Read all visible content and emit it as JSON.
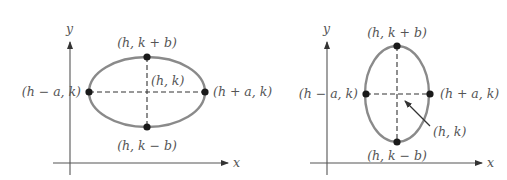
{
  "diagrams": [
    {
      "name": "horizontal-ellipse",
      "axis_labels": {
        "x": "x",
        "y": "y"
      },
      "points": {
        "top": "(h, k + b)",
        "bottom": "(h, k − b)",
        "left": "(h − a, k)",
        "right": "(h + a, k)",
        "center": "(h, k)"
      }
    },
    {
      "name": "vertical-ellipse",
      "axis_labels": {
        "x": "x",
        "y": "y"
      },
      "points": {
        "top": "(h, k + b)",
        "bottom": "(h, k − b)",
        "left": "(h − a, k)",
        "right": "(h + a, k)",
        "center": "(h, k)"
      }
    }
  ],
  "colors": {
    "ellipse": "#8a8a8a",
    "axis": "#555555",
    "dot": "#1a1a1a",
    "text": "#555555"
  }
}
